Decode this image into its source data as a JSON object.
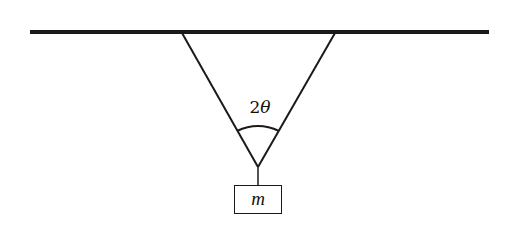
{
  "diagram": {
    "type": "physics-free-body-setup",
    "ceiling": {
      "x1": 30,
      "y1": 32,
      "x2": 489,
      "y2": 32,
      "thickness": 4,
      "color": "#1a1a1a"
    },
    "strings": [
      {
        "name": "left-string",
        "x1": 182,
        "y1": 33,
        "x2": 258,
        "y2": 167
      },
      {
        "name": "right-string",
        "x1": 335,
        "y1": 33,
        "x2": 258,
        "y2": 167
      }
    ],
    "hanger": {
      "x1": 258,
      "y1": 167,
      "x2": 258,
      "y2": 185
    },
    "angle_arc": {
      "start": {
        "x": 237,
        "y": 131
      },
      "control": {
        "x": 258,
        "y": 121
      },
      "end": {
        "x": 279,
        "y": 131
      }
    },
    "angle_label": {
      "coefficient": "2",
      "symbol": "θ"
    },
    "mass": {
      "label": "m"
    },
    "stroke_color": "#1a1a1a",
    "background": "#ffffff"
  }
}
